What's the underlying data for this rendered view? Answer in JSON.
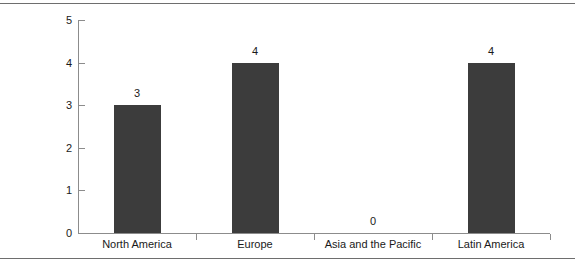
{
  "chart_data": {
    "type": "bar",
    "title": "",
    "subtitle": "",
    "xlabel": "",
    "ylabel": "",
    "categories": [
      "North America",
      "Europe",
      "Asia and the Pacific",
      "Latin America"
    ],
    "values": [
      3,
      4,
      0,
      4
    ],
    "value_labels": [
      "3",
      "4",
      "0",
      "4"
    ],
    "ylim": [
      0,
      5
    ],
    "yticks": [
      0,
      1,
      2,
      3,
      4,
      5
    ],
    "ytick_labels": [
      "0",
      "1",
      "2",
      "3",
      "4",
      "5"
    ],
    "grid": false,
    "legend": false,
    "legend_position": "none",
    "bar_color": "#3c3c3c",
    "axis_color": "#8c8c8c",
    "text_color": "#1a1a1a",
    "background": "#ffffff",
    "rule_color": "#6e6e6e"
  }
}
